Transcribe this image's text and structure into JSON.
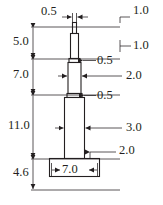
{
  "drawing": {
    "type": "engineering-dimension-drawing",
    "title": "Stepped column profile with base",
    "units": "unitless",
    "line_color": "#231f20",
    "background_color": "#ffffff",
    "dimensions": {
      "top_width": {
        "label": "0.5",
        "position": "top-left",
        "x": 41,
        "y": 12
      },
      "right_1": {
        "label": "1.0",
        "position": "top-right",
        "x": 134,
        "y": 11
      },
      "left_1": {
        "label": "5.0",
        "position": "left",
        "x": 14,
        "y": 41
      },
      "right_2": {
        "label": "1.0",
        "position": "right",
        "x": 134,
        "y": 42
      },
      "right_3": {
        "label": "0.5",
        "position": "right",
        "x": 99,
        "y": 57
      },
      "left_2": {
        "label": "7.0",
        "position": "left",
        "x": 14,
        "y": 74
      },
      "right_4": {
        "label": "2.0",
        "position": "right",
        "x": 127,
        "y": 74
      },
      "right_5": {
        "label": "0.5",
        "position": "right",
        "x": 99,
        "y": 92
      },
      "left_3": {
        "label": "11.0",
        "position": "left",
        "x": 9,
        "y": 125
      },
      "right_6": {
        "label": "3.0",
        "position": "right",
        "x": 127,
        "y": 124
      },
      "right_7": {
        "label": "2.0",
        "position": "right",
        "x": 120,
        "y": 147
      },
      "left_4": {
        "label": "4.6",
        "position": "left-bottom",
        "x": 14,
        "y": 172
      },
      "base_width": {
        "label": "7.0",
        "position": "bottom-center",
        "x": 64,
        "y": 170
      }
    }
  }
}
